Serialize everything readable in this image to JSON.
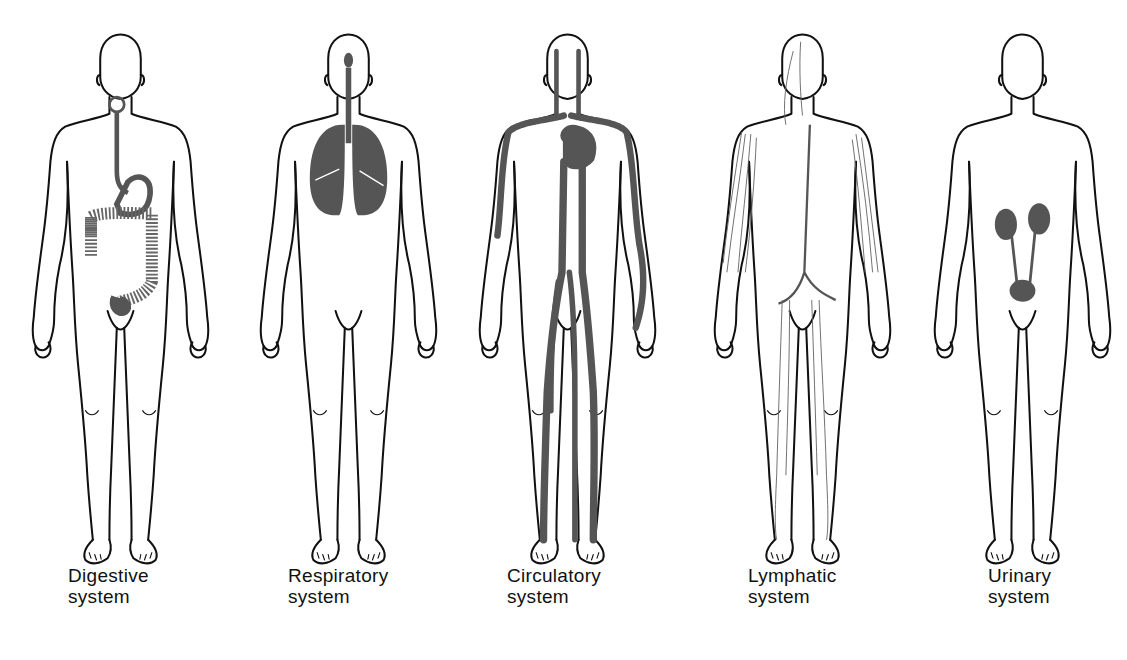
{
  "colors": {
    "outline": "#111111",
    "organ": "#555555",
    "background": "#ffffff"
  },
  "figures": [
    {
      "id": "digestive",
      "label_line1": "Digestive",
      "label_line2": "system",
      "organs": [
        "esophagus",
        "stomach",
        "large-intestine",
        "rectum"
      ]
    },
    {
      "id": "respiratory",
      "label_line1": "Respiratory",
      "label_line2": "system",
      "organs": [
        "nasal-cavity",
        "trachea",
        "lungs"
      ]
    },
    {
      "id": "circulatory",
      "label_line1": "Circulatory",
      "label_line2": "system",
      "organs": [
        "heart",
        "arteries",
        "veins"
      ]
    },
    {
      "id": "lymphatic",
      "label_line1": "Lymphatic",
      "label_line2": "system",
      "organs": [
        "lymph-vessels"
      ]
    },
    {
      "id": "urinary",
      "label_line1": "Urinary",
      "label_line2": "system",
      "organs": [
        "kidneys",
        "ureters",
        "bladder"
      ]
    }
  ]
}
